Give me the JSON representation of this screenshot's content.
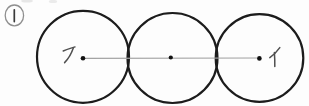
{
  "figure": {
    "item_number": "①",
    "item_number_value": "1",
    "points": {
      "left_label": "ア",
      "right_label": "イ"
    },
    "elements": {
      "circle_count": "3",
      "center_dot_count": "3"
    },
    "colors": {
      "circle_stroke": "#1c1c1c",
      "center_line": "#a3a3a3",
      "dot": "#111111",
      "label_ink": "#4f4f4f",
      "badge_outline": "#8f8f8f",
      "badge_numeral": "#3a3a3a",
      "background": "#fdfdfd"
    }
  }
}
